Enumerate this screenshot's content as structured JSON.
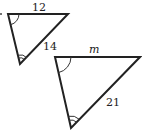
{
  "diagram": {
    "type": "similar-triangles",
    "small_triangle": {
      "vertices": {
        "top_left": [
          8,
          14
        ],
        "top_right": [
          68,
          14
        ],
        "bottom": [
          20,
          64
        ]
      },
      "top_side_label": "12",
      "right_side_label": "14",
      "angle_marks": {
        "top_left": "single-arc",
        "bottom": "double-arc"
      }
    },
    "large_triangle": {
      "vertices": {
        "top_left": [
          55,
          57
        ],
        "top_right": [
          140,
          57
        ],
        "bottom": [
          71,
          128
        ]
      },
      "top_side_label": "m",
      "right_side_label": "21",
      "angle_marks": {
        "top_left": "single-arc",
        "bottom": "double-arc"
      }
    },
    "stroke_color": "#222222",
    "background": "#ffffff"
  }
}
